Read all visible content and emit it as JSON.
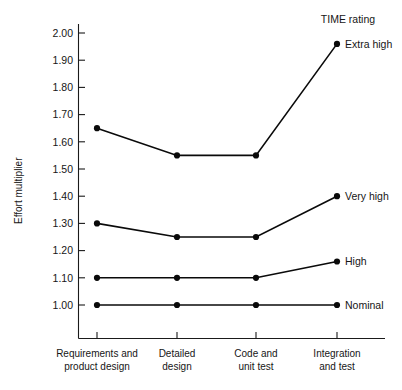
{
  "chart_data": {
    "type": "line",
    "title": "",
    "legend_title": "TIME rating",
    "legend_position": "right-of-plot, inline at series end",
    "xlabel": "",
    "ylabel": "Effort multiplier",
    "grid": false,
    "categories": [
      "Requirements and product design",
      "Detailed design",
      "Code and unit test",
      "Integration and test"
    ],
    "category_lines": [
      [
        "Requirements and",
        "product design"
      ],
      [
        "Detailed",
        "design"
      ],
      [
        "Code and",
        "unit test"
      ],
      [
        "Integration",
        "and test"
      ]
    ],
    "ylim": [
      0.95,
      2.05
    ],
    "ytick_labels": [
      "2.00",
      "1.90",
      "1.80",
      "1.70",
      "1.60",
      "1.50",
      "1.40",
      "1.30",
      "1.20",
      "1.10",
      "1.00"
    ],
    "ytick_values": [
      2.0,
      1.9,
      1.8,
      1.7,
      1.6,
      1.5,
      1.4,
      1.3,
      1.2,
      1.1,
      1.0
    ],
    "series": [
      {
        "name": "Extra high",
        "values": [
          1.65,
          1.55,
          1.55,
          1.96
        ]
      },
      {
        "name": "Very high",
        "values": [
          1.3,
          1.25,
          1.25,
          1.4
        ]
      },
      {
        "name": "High",
        "values": [
          1.1,
          1.1,
          1.1,
          1.16
        ]
      },
      {
        "name": "Nominal",
        "values": [
          1.0,
          1.0,
          1.0,
          1.0
        ]
      }
    ],
    "colors": {
      "line": "#0a0a0a",
      "marker": "#0a0a0a",
      "axis": "#1a1a1a",
      "text": "#161616",
      "background": "#ffffff"
    }
  }
}
